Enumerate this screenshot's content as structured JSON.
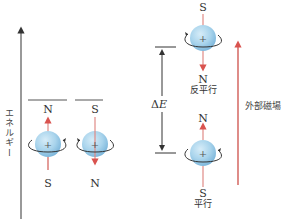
{
  "axis": {
    "label": "エネルギー"
  },
  "left_pair": {
    "spin1": {
      "top_label": "N",
      "bottom_label": "S",
      "direction": "up"
    },
    "spin2": {
      "top_label": "S",
      "bottom_label": "N",
      "direction": "down"
    }
  },
  "right_levels": {
    "antiparallel": {
      "top_label": "S",
      "bottom_label": "N",
      "name": "反平行"
    },
    "parallel": {
      "top_label": "N",
      "bottom_label": "S",
      "name": "平行"
    },
    "energy_gap": {
      "symbol": "Δ",
      "var": "E"
    }
  },
  "field": {
    "label": "外部磁場"
  },
  "colors": {
    "sphere": "#a9d4ec",
    "arrow_red": "#d9534f",
    "field_red": "#c9403a",
    "line": "#555555"
  },
  "captions": {
    "left": "",
    "right": ""
  }
}
